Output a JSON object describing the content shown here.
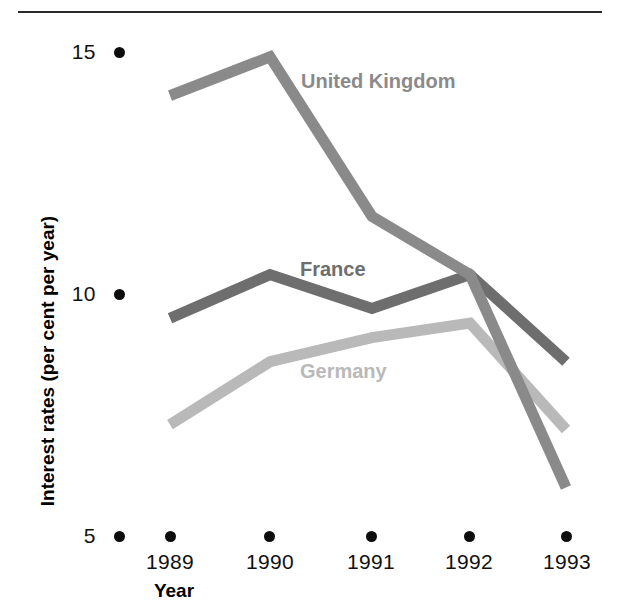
{
  "figure": {
    "has_top_rule": true,
    "background": "#ffffff"
  },
  "axes": {
    "y_title": "Interest rates (per cent per year)",
    "x_title": "Year",
    "y_ticks": [
      "15",
      "10",
      "5"
    ],
    "x_ticks": [
      "1989",
      "1990",
      "1991",
      "1992",
      "1993"
    ]
  },
  "labels": {
    "united_kingdom": "United Kingdom",
    "france": "France",
    "germany": "Germany"
  },
  "colors": {
    "united_kingdom": "#8a8a8a",
    "france": "#6e6e6e",
    "germany": "#b9b9b9",
    "tick_dot": "#0d0d0d",
    "rule": "#2a2a2a",
    "text": "#111111"
  },
  "chart_data": {
    "type": "line",
    "title": "",
    "xlabel": "Year",
    "ylabel": "Interest rates (per cent per year)",
    "categories": [
      "1989",
      "1990",
      "1991",
      "1992",
      "1993"
    ],
    "ylim": [
      5,
      15
    ],
    "yticks": [
      5,
      10,
      15
    ],
    "grid": false,
    "legend": "inline-series-labels",
    "series": [
      {
        "name": "United Kingdom",
        "color": "#8a8a8a",
        "values": [
          14.1,
          14.9,
          11.6,
          10.4,
          6.0
        ]
      },
      {
        "name": "France",
        "color": "#6e6e6e",
        "values": [
          9.5,
          10.4,
          9.7,
          10.4,
          8.6
        ]
      },
      {
        "name": "Germany",
        "color": "#b9b9b9",
        "values": [
          7.3,
          8.6,
          9.1,
          9.4,
          7.2
        ]
      }
    ]
  }
}
